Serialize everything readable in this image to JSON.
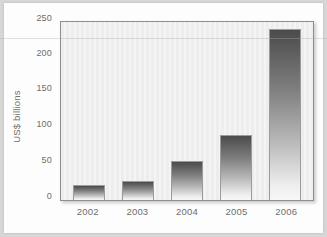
{
  "chart_data": {
    "type": "bar",
    "title": "",
    "subtitle": "",
    "xlabel": "",
    "ylabel": "US$ billions",
    "categories": [
      "2002",
      "2003",
      "2004",
      "2005",
      "2006"
    ],
    "values": [
      21,
      27,
      55,
      91,
      240
    ],
    "series": [
      {
        "name": "US$ billions",
        "values": [
          21,
          27,
          55,
          91,
          240
        ]
      }
    ],
    "ylim": [
      0,
      250
    ],
    "yticks": [
      0,
      50,
      100,
      150,
      200,
      250
    ],
    "ytick_labels": [
      "0",
      "50",
      "100",
      "150",
      "200",
      "250"
    ],
    "grid": false,
    "legend": false,
    "legend_position": "none",
    "bar_fill": "vertical gradient dark-grey to white",
    "colors": {
      "bar_top": "#4b4b4b",
      "bar_bottom": "#f7f7f7",
      "bar_border": "#9b9b9b",
      "plot_background": "#ededed",
      "plot_border": "#8e8e8e",
      "figure_background": "#fdfdfd",
      "outer_margin": "#d7d7d7",
      "tick_label": "#6d6d6d"
    },
    "annotations": []
  }
}
